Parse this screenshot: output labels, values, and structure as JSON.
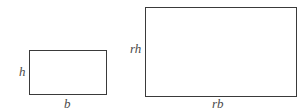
{
  "diagram": {
    "shapes": [
      {
        "id": "small-rectangle",
        "height_label": "h",
        "base_label": "b"
      },
      {
        "id": "large-rectangle",
        "height_label": "rh",
        "base_label": "rb"
      }
    ],
    "colors": {
      "stroke": "#3a3a3a",
      "label": "#4a4a4a",
      "background": "#ffffff"
    }
  }
}
